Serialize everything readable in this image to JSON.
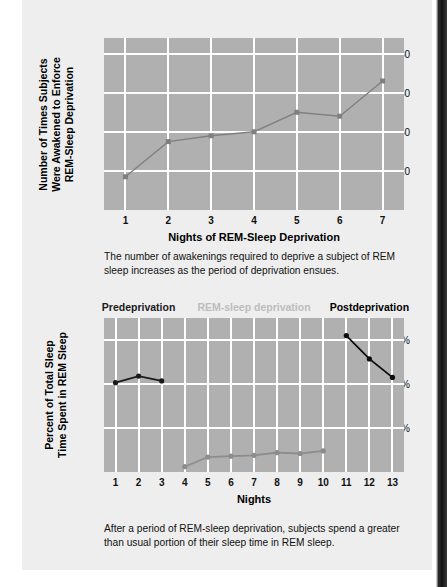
{
  "page": {
    "background_color": "#ffffff",
    "panel_color": "#eeeeee",
    "plot_color": "#b0b0b0",
    "gridline_color": "#ffffff"
  },
  "figure_top": {
    "caption": "The number of awakenings required to deprive a subject of REM sleep increases as the period of deprivation ensues.",
    "chart_data": {
      "type": "line",
      "title": "",
      "xlabel": "Nights of REM-Sleep Deprivation",
      "ylabel": "Number of Times Subjects Were Awakened to Enforce REM-Sleep Deprivation",
      "ylabel_lines": [
        "Number of Times Subjects",
        "Were Awakened to Enforce",
        "REM-Sleep Deprivation"
      ],
      "categories": [
        1,
        2,
        3,
        4,
        5,
        6,
        7
      ],
      "xtick_labels": [
        "1",
        "2",
        "3",
        "4",
        "5",
        "6",
        "7"
      ],
      "values": [
        17,
        35,
        38,
        40,
        50,
        48,
        66
      ],
      "ytick_values": [
        20,
        40,
        60,
        80
      ],
      "ytick_labels": [
        "20",
        "40",
        "60",
        "80"
      ],
      "ylim": [
        0,
        88
      ],
      "xlim": [
        0.5,
        7.5
      ],
      "grid": true,
      "legend": "none",
      "series_color": "#808080",
      "marker": "square"
    }
  },
  "figure_bottom": {
    "caption": "After a period of REM-sleep deprivation, subjects spend a greater than usual portion of their sleep time in REM sleep.",
    "segment_labels": [
      {
        "text": "Predeprivation",
        "color": "#1a1a1a",
        "center_night": 2
      },
      {
        "text": "REM-sleep deprivation",
        "color": "#bdbdbd",
        "center_night": 7
      },
      {
        "text": "Postdeprivation",
        "color": "#000000",
        "center_night": 12
      }
    ],
    "chart_data": {
      "type": "line",
      "title": "",
      "xlabel": "Nights",
      "ylabel": "Percent of Total Sleep Time Spent in REM Sleep",
      "ylabel_lines": [
        "Percent of Total Sleep",
        "Time Spent in REM Sleep"
      ],
      "categories": [
        1,
        2,
        3,
        4,
        5,
        6,
        7,
        8,
        9,
        10,
        11,
        12,
        13
      ],
      "xtick_labels": [
        "1",
        "2",
        "3",
        "4",
        "5",
        "6",
        "7",
        "8",
        "9",
        "10",
        "11",
        "12",
        "13"
      ],
      "ytick_values": [
        10,
        20,
        30
      ],
      "ytick_labels": [
        "10%",
        "20%",
        "30%"
      ],
      "ylim": [
        0,
        35
      ],
      "xlim": [
        0.5,
        13.5
      ],
      "grid": true,
      "legend": "above-plot",
      "series": [
        {
          "name": "Predeprivation",
          "color": "#1a1a1a",
          "marker": "circle",
          "x": [
            1,
            2,
            3
          ],
          "values": [
            20.3,
            21.8,
            20.7
          ]
        },
        {
          "name": "REM-sleep deprivation",
          "color": "#8c8c8c",
          "marker": "circle",
          "x": [
            4,
            5,
            6,
            7,
            8,
            9,
            10
          ],
          "values": [
            1.2,
            3.4,
            3.6,
            3.8,
            4.4,
            4.2,
            4.8
          ]
        },
        {
          "name": "Postdeprivation",
          "color": "#0d0d0d",
          "marker": "circle",
          "x": [
            11,
            12,
            13
          ],
          "values": [
            31.0,
            25.7,
            21.5
          ]
        }
      ]
    }
  }
}
